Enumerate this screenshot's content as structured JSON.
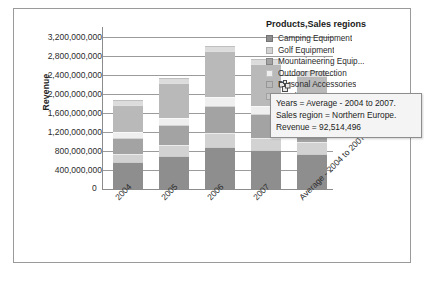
{
  "chart_data": {
    "type": "bar",
    "stacked": true,
    "title": "",
    "xlabel": "",
    "ylabel": "Revenue",
    "ylim": [
      0,
      3400000000
    ],
    "grid": true,
    "legend_position": "right",
    "y_ticks": [
      "0",
      "400,000,000",
      "800,000,000",
      "1,200,000,000",
      "1,600,000,000",
      "2,000,000,000",
      "2,400,000,000",
      "2,800,000,000",
      "3,200,000,000"
    ],
    "y_tick_values": [
      0,
      400000000,
      800000000,
      1200000000,
      1600000000,
      2000000000,
      2400000000,
      2800000000,
      3200000000
    ],
    "categories": [
      "2004",
      "2005",
      "2006",
      "2007",
      "Average - 2004 to 2007"
    ],
    "series": [
      {
        "name": "Camping Equipment",
        "color": "#8e8e8e",
        "values": [
          560000000,
          700000000,
          880000000,
          820000000,
          740000000
        ]
      },
      {
        "name": "Golf Equipment",
        "color": "#d2d2d2",
        "values": [
          180000000,
          230000000,
          300000000,
          250000000,
          240000000
        ]
      },
      {
        "name": "Mountaineering Equip...",
        "color": "#a3a3a3",
        "values": [
          330000000,
          420000000,
          560000000,
          500000000,
          450000000
        ]
      },
      {
        "name": "Outdoor Protection",
        "color": "#efefef",
        "values": [
          120000000,
          150000000,
          190000000,
          170000000,
          160000000
        ]
      },
      {
        "name": "Personal Accessories",
        "color": "#b9b9b9",
        "values": [
          570000000,
          730000000,
          960000000,
          880000000,
          790000000
        ]
      }
    ],
    "hidden_legend_entries": [
      {
        "name": "Southern Europe",
        "color": "#c6c6c6"
      }
    ]
  },
  "legend": {
    "title": "Products,Sales regions",
    "items": [
      {
        "label": "Camping Equipment",
        "color": "#8e8e8e"
      },
      {
        "label": "Golf Equipment",
        "color": "#d2d2d2"
      },
      {
        "label": "Mountaineering Equip...",
        "color": "#a3a3a3"
      },
      {
        "label": "Outdoor Protection",
        "color": "#efefef"
      },
      {
        "label": "Personal Accessories",
        "color": "#b9b9b9"
      },
      {
        "label": "Southern Europe",
        "color": "#c6c6c6"
      }
    ]
  },
  "tooltip": {
    "lines": [
      "Years = Average - 2004 to 2007.",
      "Sales region = Northern Europe.",
      "Revenue = 92,514,496"
    ]
  },
  "cursor": {
    "icon": "pointer-copy-icon"
  }
}
